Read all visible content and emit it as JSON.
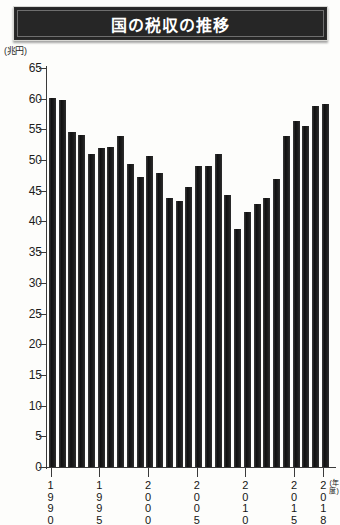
{
  "header": {
    "title": "国の税収の推移"
  },
  "axis": {
    "unit_label": "(兆円)",
    "x_unit_label": "(年度)",
    "y_ticks": [
      65,
      60,
      55,
      50,
      45,
      40,
      35,
      30,
      25,
      20,
      15,
      10,
      5,
      0
    ],
    "x_tick_labels": [
      "1990",
      "1995",
      "2000",
      "2005",
      "2010",
      "2015",
      "2018"
    ]
  },
  "colors": {
    "bar": "#1b1b1b",
    "title_background": "#262626",
    "title_text": "#ffffff",
    "axis": "#3a3a3a",
    "page_background": "#fdfdfb"
  },
  "chart_data": {
    "type": "bar",
    "title": "国の税収の推移",
    "xlabel": "(年度)",
    "ylabel": "(兆円)",
    "ylim": [
      0,
      65
    ],
    "grid": false,
    "legend": "none",
    "categories": [
      "1990",
      "1991",
      "1992",
      "1993",
      "1994",
      "1995",
      "1996",
      "1997",
      "1998",
      "1999",
      "2000",
      "2001",
      "2002",
      "2003",
      "2004",
      "2005",
      "2006",
      "2007",
      "2008",
      "2009",
      "2010",
      "2011",
      "2012",
      "2013",
      "2014",
      "2015",
      "2016",
      "2017",
      "2018"
    ],
    "values": [
      60.1,
      59.8,
      54.5,
      54.1,
      51.0,
      51.9,
      52.1,
      53.9,
      49.4,
      47.2,
      50.7,
      47.9,
      43.8,
      43.3,
      45.6,
      49.1,
      49.1,
      51.0,
      44.3,
      38.7,
      41.5,
      42.8,
      43.9,
      47.0,
      54.0,
      56.3,
      55.5,
      58.8,
      59.1
    ],
    "value_labels_visible": false
  }
}
